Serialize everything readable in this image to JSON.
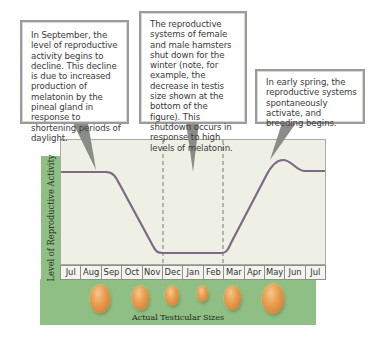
{
  "callouts": [
    {
      "id": "september",
      "text": "In September, the level of reproductive activity begins to decline. This decline is due to increased production of melatonin by the pineal gland in response to shortening periods of daylight."
    },
    {
      "id": "winter",
      "text": "The reproductive systems of female and male hamsters shut down for the winter (note, for example, the decrease in testis size shown at the bottom of the figure). This shutdown occurs in response to high levels of melatonin."
    },
    {
      "id": "spring",
      "text": "In early spring, the reproductive systems spontaneously activate, and breeding begins."
    }
  ],
  "axes": {
    "ylabel": "Level of Reproductive Activity",
    "xcaption": "Actual Testicular Sizes"
  },
  "months": [
    "Jul",
    "Aug",
    "Sep",
    "Oct",
    "Nov",
    "Dec",
    "Jan",
    "Feb",
    "Mar",
    "Apr",
    "May",
    "Jun",
    "Jul"
  ],
  "testes": [
    {
      "month": "Aug",
      "size": "large"
    },
    {
      "month": "Oct",
      "size": "medium-large"
    },
    {
      "month": "Nov/Dec",
      "size": "medium"
    },
    {
      "month": "Jan",
      "size": "small"
    },
    {
      "month": "Mar",
      "size": "medium-large"
    },
    {
      "month": "May",
      "size": "largest"
    }
  ],
  "colors": {
    "green_band": "#8fbf85",
    "plot_bg": "#eef0e6",
    "curve": "#7d6a86",
    "callout_border": "#9a9c98"
  },
  "curve": {
    "description": "High plateau Jul–Aug, decline Sep–Nov, low plateau Dec–Feb (dashed markers), rise Mar–Apr, peak May, settle to plateau Jun–Jul",
    "points": [
      {
        "month": "Jul",
        "level": "high"
      },
      {
        "month": "Aug",
        "level": "high"
      },
      {
        "month": "Sep",
        "level": "declining"
      },
      {
        "month": "Nov",
        "level": "low"
      },
      {
        "month": "Dec",
        "level": "low"
      },
      {
        "month": "Feb",
        "level": "low"
      },
      {
        "month": "Apr",
        "level": "rising"
      },
      {
        "month": "May",
        "level": "peak"
      },
      {
        "month": "Jun",
        "level": "high"
      },
      {
        "month": "Jul",
        "level": "high"
      }
    ]
  }
}
